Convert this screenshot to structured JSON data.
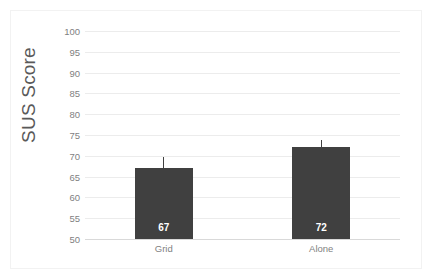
{
  "chart_data": {
    "type": "bar",
    "title": "",
    "xlabel": "",
    "ylabel": "SUS Score",
    "categories": [
      "Grid",
      "Alone"
    ],
    "values": [
      67,
      72
    ],
    "value_labels": [
      "67",
      "72"
    ],
    "error_bars": {
      "upper": [
        69.7,
        73.8
      ],
      "lower": [
        67,
        72
      ]
    },
    "ylim": [
      50,
      100
    ],
    "ytick_labels": [
      "100",
      "95",
      "90",
      "85",
      "80",
      "75",
      "70",
      "65",
      "60",
      "55",
      "50"
    ],
    "ytick_values": [
      100,
      95,
      90,
      85,
      80,
      75,
      70,
      65,
      60,
      55,
      50
    ],
    "grid": true,
    "legend": false,
    "colors": {
      "bar": "#404040",
      "gridline": "#ececec",
      "axis_base": "#d9d9d9",
      "tick_text": "#7f7f7f",
      "axis_title_text": "#595959",
      "value_label_text": "#ffffff",
      "background": "#ffffff",
      "frame_border": "#f2f2f2"
    }
  }
}
